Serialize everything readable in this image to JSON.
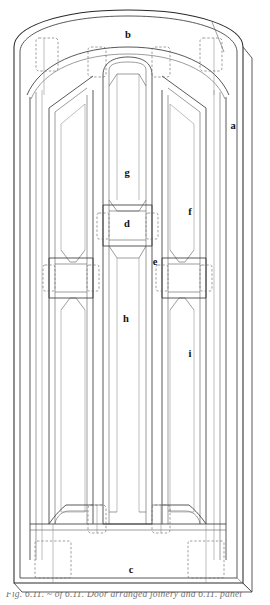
{
  "figure": {
    "kind": "technical-line-drawing",
    "caption_partial": "Fig. 6.11.  ~ of 6.11. Door arranged joinery and 6.11. panel"
  },
  "colors": {
    "background": "#ffffff",
    "line": "#3b3b3b",
    "line_light": "#7d7d7d",
    "hidden_line": "#6a6a6a",
    "label": "#111111"
  },
  "labels": [
    {
      "key": "a",
      "text": "a",
      "x": 233,
      "y": 127,
      "refers_to": "outer frame / door jamb stile"
    },
    {
      "key": "b",
      "text": "b",
      "x": 128,
      "y": 36,
      "refers_to": "arched head rail"
    },
    {
      "key": "c",
      "text": "c",
      "x": 131,
      "y": 571,
      "refers_to": "bottom rail"
    },
    {
      "key": "d",
      "text": "d",
      "x": 127,
      "y": 225,
      "refers_to": "middle rail of centre panel"
    },
    {
      "key": "e",
      "text": "e",
      "x": 155,
      "y": 263,
      "refers_to": "lock rail joint"
    },
    {
      "key": "f",
      "text": "f",
      "x": 190,
      "y": 213,
      "refers_to": "upper side panel"
    },
    {
      "key": "g",
      "text": "g",
      "x": 127,
      "y": 174,
      "refers_to": "upper centre panel"
    },
    {
      "key": "h",
      "text": "h",
      "x": 126,
      "y": 320,
      "refers_to": "lower centre panel / muntin"
    },
    {
      "key": "i",
      "text": "i",
      "x": 190,
      "y": 355,
      "refers_to": "lower side panel"
    }
  ]
}
